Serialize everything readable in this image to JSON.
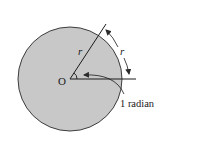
{
  "diagram": {
    "center_label": "O",
    "radius_label_1": "r",
    "radius_label_2": "r",
    "angle_label": "1 radian",
    "colors": {
      "fill": "#c8c8c8",
      "stroke": "#2a2a2a",
      "background": "#ffffff"
    }
  }
}
